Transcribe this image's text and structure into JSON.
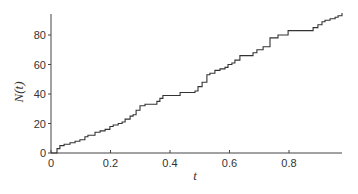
{
  "chart_data": {
    "type": "line",
    "title": "",
    "xlabel": "t",
    "ylabel": "N(t)",
    "xlim": [
      0,
      1.0
    ],
    "ylim": [
      0,
      95
    ],
    "xticks": [
      0,
      0.2,
      0.4,
      0.6,
      0.8
    ],
    "xtick_labels": [
      "0",
      "0.2",
      "0.4",
      "0.6",
      "0.8"
    ],
    "yticks": [
      0,
      20,
      40,
      60,
      80
    ],
    "ytick_labels": [
      "0",
      "20",
      "40",
      "60",
      "80"
    ],
    "grid": false,
    "legend": null,
    "series": [
      {
        "name": "N(t)",
        "style": "step",
        "x": [
          0,
          0.013,
          0.02,
          0.03,
          0.044,
          0.064,
          0.081,
          0.097,
          0.114,
          0.124,
          0.148,
          0.165,
          0.182,
          0.198,
          0.209,
          0.226,
          0.239,
          0.249,
          0.266,
          0.276,
          0.286,
          0.299,
          0.316,
          0.333,
          0.356,
          0.366,
          0.376,
          0.427,
          0.434,
          0.484,
          0.494,
          0.508,
          0.524,
          0.534,
          0.551,
          0.568,
          0.585,
          0.595,
          0.608,
          0.618,
          0.635,
          0.652,
          0.669,
          0.679,
          0.692,
          0.713,
          0.736,
          0.763,
          0.787,
          0.797,
          0.877,
          0.881,
          0.897,
          0.911,
          0.921,
          0.938,
          0.955,
          0.965,
          0.978
        ],
        "y": [
          0,
          0,
          3,
          5,
          6,
          7,
          8,
          9,
          11,
          12,
          14,
          15,
          16,
          18,
          19,
          20,
          21,
          23,
          25,
          26,
          29,
          32,
          33,
          33,
          35,
          37,
          39,
          39,
          41,
          42,
          45,
          48,
          53,
          54,
          56,
          57,
          58,
          60,
          61,
          63,
          66,
          66,
          66,
          68,
          70,
          72,
          78,
          80,
          80,
          83,
          83,
          85,
          87,
          89,
          90,
          91,
          92,
          93,
          95
        ]
      }
    ]
  }
}
